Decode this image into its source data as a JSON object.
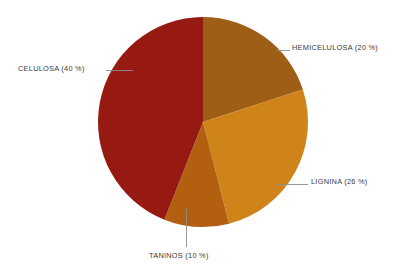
{
  "background_color": "#ffffff",
  "chart_data": {
    "type": "pie",
    "title": "",
    "subtitle": "",
    "xlabel": "",
    "ylabel": "",
    "legend_position": "none",
    "grid": false,
    "labels_inline": true,
    "units": "%",
    "categories": [
      "HEMICELULOSA",
      "LIGNINA",
      "TANINOS",
      "CELULOSA"
    ],
    "values": [
      20,
      26,
      10,
      40
    ],
    "colors": [
      "#9e5e15",
      "#ce8418",
      "#b35f10",
      "#971a12"
    ],
    "start_angle_deg": 0,
    "direction": "clockwise",
    "annotations": [
      "HEMICELULOSA (20 %)",
      "LIGNINA (26 %)",
      "TANINOS (10 %)",
      "CELULOSA (40 %)"
    ],
    "slices": [
      {
        "name": "hemicelulosa",
        "label": "HEMICELULOSA (20 %)",
        "category": "HEMICELULOSA",
        "value": 20,
        "color": "#9e5e15",
        "start_deg": 0,
        "end_deg": 72
      },
      {
        "name": "lignina",
        "label": "LIGNINA (26 %)",
        "category": "LIGNINA",
        "value": 26,
        "color": "#ce8418",
        "start_deg": 72,
        "end_deg": 165.6
      },
      {
        "name": "taninos",
        "label": "TANINOS (10 %)",
        "category": "TANINOS",
        "value": 10,
        "color": "#b35f10",
        "start_deg": 165.6,
        "end_deg": 201.6
      },
      {
        "name": "celulosa",
        "label": "CELULOSA (40 %)",
        "category": "CELULOSA",
        "value": 40,
        "color": "#971a12",
        "start_deg": 201.6,
        "end_deg": 360
      }
    ]
  },
  "geometry": {
    "center_x": 203,
    "center_y": 122,
    "radius": 105
  },
  "labels": {
    "hemicelulosa": "HEMICELULOSA (20 %)",
    "lignina": "LIGNINA (26 %)",
    "taninos": "TANINOS (10 %)",
    "celulosa": "CELULOSA (40 %)"
  }
}
